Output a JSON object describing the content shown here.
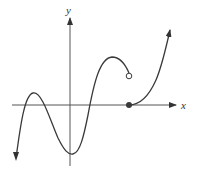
{
  "graph": {
    "axes": {
      "x_label": "x",
      "y_label": "y"
    },
    "colors": {
      "curve": "#3a3a3a",
      "axis": "#444444",
      "background": "#ffffff"
    },
    "features": {
      "open_circle": {
        "description": "open endpoint of left piece",
        "x": 129,
        "y": 76
      },
      "closed_dot": {
        "description": "filled endpoint on x-axis starting right piece",
        "x": 129,
        "y": 105
      }
    }
  }
}
